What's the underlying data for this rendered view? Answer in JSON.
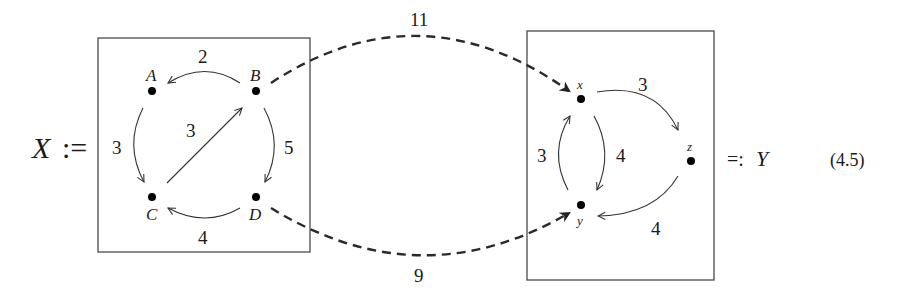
{
  "diagram": {
    "type": "weighted directed graph morphism",
    "left_graph": {
      "name": "X",
      "definition_symbol": ":=",
      "nodes": [
        {
          "id": "A",
          "label": "A"
        },
        {
          "id": "B",
          "label": "B"
        },
        {
          "id": "C",
          "label": "C"
        },
        {
          "id": "D",
          "label": "D"
        }
      ],
      "edges": [
        {
          "from": "B",
          "to": "A",
          "weight": "2"
        },
        {
          "from": "A",
          "to": "C",
          "weight": "3"
        },
        {
          "from": "C",
          "to": "B",
          "weight": "3"
        },
        {
          "from": "B",
          "to": "D",
          "weight": "5"
        },
        {
          "from": "D",
          "to": "C",
          "weight": "4"
        }
      ]
    },
    "right_graph": {
      "name": "Y",
      "definition_symbol": "=:",
      "nodes": [
        {
          "id": "x",
          "label": "x"
        },
        {
          "id": "y",
          "label": "y"
        },
        {
          "id": "z",
          "label": "z"
        }
      ],
      "edges": [
        {
          "from": "x",
          "to": "z",
          "weight": "3"
        },
        {
          "from": "x",
          "to": "y",
          "weight": "4"
        },
        {
          "from": "y",
          "to": "x",
          "weight": "3"
        },
        {
          "from": "z",
          "to": "y",
          "weight": "4"
        }
      ]
    },
    "mapping_edges": [
      {
        "from": "B",
        "to": "x",
        "weight": "11",
        "style": "dashed"
      },
      {
        "from": "D",
        "to": "y",
        "weight": "9",
        "style": "dashed"
      }
    ],
    "equation_number": "(4.5)"
  },
  "colors": {
    "ink": "#1a1a1a",
    "box": "#4a4a4a",
    "background": "#ffffff"
  }
}
